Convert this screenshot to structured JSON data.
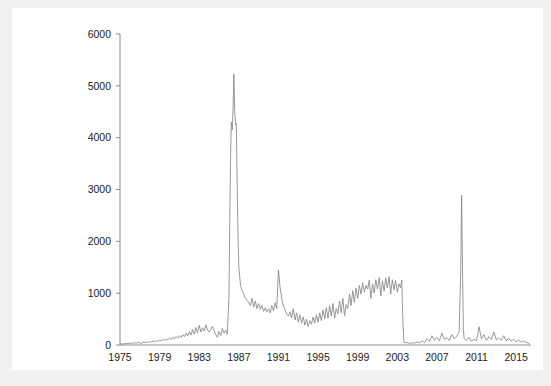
{
  "colors": {
    "page_background": "#f1f1f1",
    "card_background": "#ffffff",
    "series": "#8c8c8c",
    "axis": "#8a8a8a",
    "text": "#1c1c1c"
  },
  "chart_data": {
    "type": "line",
    "title": "",
    "subtitle": "",
    "xlabel": "",
    "ylabel": "",
    "xlim": [
      1975,
      2016.5
    ],
    "ylim": [
      0,
      6000
    ],
    "grid": false,
    "legend": null,
    "annotations": [],
    "y_ticks": [
      0,
      1000,
      2000,
      3000,
      4000,
      5000,
      6000
    ],
    "y_tick_labels": [
      "0",
      "1000",
      "2000",
      "3000",
      "4000",
      "5000",
      "6000"
    ],
    "x_ticks": [
      1975,
      1979,
      1983,
      1987,
      1991,
      1995,
      1999,
      2003,
      2007,
      2011,
      2015
    ],
    "x_tick_labels": [
      "1975",
      "1979",
      "1983",
      "1987",
      "1991",
      "1995",
      "1999",
      "2003",
      "2007",
      "2011",
      "2015"
    ],
    "series_name": "value",
    "x": [
      1975.0,
      1975.17,
      1975.33,
      1975.5,
      1975.67,
      1975.83,
      1976.0,
      1976.17,
      1976.33,
      1976.5,
      1976.67,
      1976.83,
      1977.0,
      1977.17,
      1977.33,
      1977.5,
      1977.67,
      1977.83,
      1978.0,
      1978.17,
      1978.33,
      1978.5,
      1978.67,
      1978.83,
      1979.0,
      1979.17,
      1979.33,
      1979.5,
      1979.67,
      1979.83,
      1980.0,
      1980.17,
      1980.33,
      1980.5,
      1980.67,
      1980.83,
      1981.0,
      1981.17,
      1981.33,
      1981.5,
      1981.67,
      1981.83,
      1982.0,
      1982.17,
      1982.33,
      1982.5,
      1982.67,
      1982.83,
      1983.0,
      1983.17,
      1983.33,
      1983.5,
      1983.67,
      1983.83,
      1984.0,
      1984.17,
      1984.33,
      1984.5,
      1984.67,
      1984.83,
      1985.0,
      1985.17,
      1985.33,
      1985.5,
      1985.67,
      1985.83,
      1986.0,
      1986.08,
      1986.17,
      1986.25,
      1986.33,
      1986.42,
      1986.5,
      1986.58,
      1986.67,
      1986.75,
      1986.83,
      1986.92,
      1987.0,
      1987.17,
      1987.33,
      1987.5,
      1987.67,
      1987.83,
      1988.0,
      1988.17,
      1988.33,
      1988.5,
      1988.67,
      1988.83,
      1989.0,
      1989.17,
      1989.33,
      1989.5,
      1989.67,
      1989.83,
      1990.0,
      1990.17,
      1990.33,
      1990.5,
      1990.67,
      1990.83,
      1991.0,
      1991.17,
      1991.33,
      1991.5,
      1991.67,
      1991.83,
      1992.0,
      1992.17,
      1992.33,
      1992.5,
      1992.67,
      1992.83,
      1993.0,
      1993.17,
      1993.33,
      1993.5,
      1993.67,
      1993.83,
      1994.0,
      1994.17,
      1994.33,
      1994.5,
      1994.67,
      1994.83,
      1995.0,
      1995.17,
      1995.33,
      1995.5,
      1995.67,
      1995.83,
      1996.0,
      1996.17,
      1996.33,
      1996.5,
      1996.67,
      1996.83,
      1997.0,
      1997.17,
      1997.33,
      1997.5,
      1997.67,
      1997.83,
      1998.0,
      1998.17,
      1998.33,
      1998.5,
      1998.67,
      1998.83,
      1999.0,
      1999.17,
      1999.33,
      1999.5,
      1999.67,
      1999.83,
      2000.0,
      2000.17,
      2000.33,
      2000.5,
      2000.67,
      2000.83,
      2001.0,
      2001.17,
      2001.33,
      2001.5,
      2001.67,
      2001.83,
      2002.0,
      2002.17,
      2002.33,
      2002.5,
      2002.67,
      2002.83,
      2003.0,
      2003.17,
      2003.33,
      2003.45,
      2003.5,
      2003.58,
      2003.67,
      2003.83,
      2004.0,
      2004.25,
      2004.5,
      2004.75,
      2005.0,
      2005.25,
      2005.5,
      2005.75,
      2006.0,
      2006.25,
      2006.5,
      2006.75,
      2007.0,
      2007.25,
      2007.5,
      2007.75,
      2008.0,
      2008.25,
      2008.5,
      2008.75,
      2009.0,
      2009.25,
      2009.4,
      2009.5,
      2009.58,
      2009.67,
      2009.75,
      2010.0,
      2010.25,
      2010.5,
      2010.75,
      2011.0,
      2011.25,
      2011.5,
      2011.75,
      2012.0,
      2012.25,
      2012.5,
      2012.75,
      2013.0,
      2013.25,
      2013.5,
      2013.75,
      2014.0,
      2014.25,
      2014.5,
      2014.75,
      2015.0,
      2015.25,
      2015.5,
      2015.75,
      2016.0,
      2016.3
    ],
    "values": [
      15,
      25,
      18,
      30,
      22,
      35,
      28,
      40,
      30,
      45,
      35,
      50,
      40,
      30,
      55,
      45,
      60,
      50,
      65,
      55,
      75,
      60,
      85,
      70,
      95,
      75,
      110,
      90,
      120,
      100,
      130,
      105,
      150,
      120,
      165,
      130,
      180,
      145,
      200,
      160,
      230,
      175,
      260,
      190,
      300,
      210,
      340,
      230,
      380,
      250,
      330,
      270,
      390,
      290,
      250,
      300,
      360,
      280,
      200,
      150,
      260,
      180,
      320,
      230,
      290,
      210,
      900,
      2300,
      3700,
      4300,
      4150,
      4600,
      5230,
      4500,
      4250,
      4270,
      3100,
      2100,
      1500,
      1150,
      1050,
      980,
      900,
      860,
      820,
      760,
      900,
      730,
      850,
      700,
      800,
      690,
      760,
      650,
      720,
      640,
      700,
      620,
      760,
      660,
      820,
      700,
      1450,
      1100,
      900,
      750,
      680,
      600,
      560,
      640,
      520,
      700,
      480,
      620,
      440,
      580,
      420,
      540,
      380,
      500,
      360,
      470,
      400,
      540,
      420,
      580,
      440,
      620,
      470,
      680,
      500,
      720,
      520,
      760,
      560,
      800,
      520,
      700,
      600,
      850,
      620,
      900,
      560,
      780,
      700,
      980,
      760,
      1050,
      820,
      1100,
      900,
      1150,
      980,
      1200,
      1020,
      1150,
      1080,
      1250,
      900,
      1180,
      1000,
      1260,
      1080,
      1300,
      950,
      1240,
      1040,
      1290,
      1100,
      1320,
      980,
      1260,
      1060,
      1240,
      1020,
      1180,
      1100,
      1250,
      900,
      400,
      60,
      40,
      50,
      30,
      45,
      35,
      60,
      40,
      80,
      50,
      120,
      70,
      180,
      90,
      150,
      80,
      230,
      110,
      140,
      90,
      200,
      120,
      160,
      260,
      1400,
      2890,
      1500,
      300,
      120,
      90,
      150,
      70,
      110,
      80,
      350,
      120,
      200,
      90,
      160,
      110,
      250,
      100,
      140,
      90,
      180,
      80,
      130,
      70,
      110,
      60,
      95,
      55,
      80,
      50,
      30
    ]
  }
}
